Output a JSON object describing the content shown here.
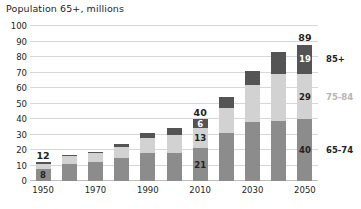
{
  "chart_data": {
    "type": "bar",
    "subtype": "stacked-column",
    "title": "Population 65+, millions",
    "xlabel": "",
    "ylabel": "",
    "ylim": [
      0,
      100
    ],
    "ytick_step": 10,
    "yticks": [
      0,
      10,
      20,
      30,
      40,
      50,
      60,
      70,
      80,
      90,
      100
    ],
    "ytick_labels": [
      "0",
      "10",
      "20",
      "30",
      "40",
      "50",
      "60",
      "70",
      "80",
      "90",
      "100"
    ],
    "grid": true,
    "legend_position": "right-inline",
    "categories": [
      1950,
      1960,
      1970,
      1980,
      1990,
      2000,
      2010,
      2020,
      2030,
      2040,
      2050
    ],
    "xtick_labels": [
      "1950",
      "",
      "1970",
      "",
      "1990",
      "",
      "2010",
      "",
      "2030",
      "",
      "2050"
    ],
    "series": [
      {
        "name": "65-74",
        "color": "#8c8c8c",
        "values": [
          8,
          11,
          12,
          15,
          18,
          18,
          21,
          31,
          38,
          39,
          40
        ]
      },
      {
        "name": "75-84",
        "color": "#d2d2d2",
        "values": [
          3,
          5,
          6,
          7,
          10,
          12,
          13,
          16,
          24,
          30,
          29
        ]
      },
      {
        "name": "85+",
        "color": "#545454",
        "values": [
          1,
          1,
          1,
          2,
          3,
          4,
          6,
          7,
          9,
          14,
          19
        ]
      }
    ],
    "totals": [
      12,
      17,
      19,
      24,
      31,
      34,
      40,
      54,
      71,
      83,
      89
    ],
    "annotations": {
      "labeled_bars": [
        {
          "category": 1950,
          "total": "12",
          "segment_labels": {
            "65-74": "8",
            "75-84": "",
            "85+": ""
          }
        },
        {
          "category": 2010,
          "total": "40",
          "segment_labels": {
            "65-74": "21",
            "75-84": "13",
            "85+": "6"
          }
        },
        {
          "category": 2050,
          "total": "89",
          "segment_labels": {
            "65-74": "40",
            "75-84": "29",
            "85+": "19"
          }
        }
      ]
    },
    "series_labels": [
      {
        "text": "85+",
        "style": "strong",
        "value_at": 19
      },
      {
        "text": "75-84",
        "style": "muted",
        "value_at": 29
      },
      {
        "text": "65-74",
        "style": "strong",
        "value_at": 40
      }
    ]
  }
}
